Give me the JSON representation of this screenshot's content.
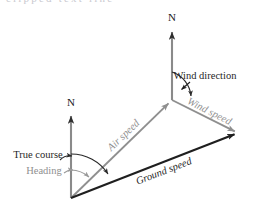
{
  "figure": {
    "kind": "vector-diagram",
    "topic": "aircraft navigation velocity triangle",
    "background_color": "#ffffff"
  },
  "colors": {
    "dark": "#1f1f1f",
    "gray": "#909090",
    "axis_gray": "#8a8a8a",
    "arc_dark": "#2a2a2a",
    "arc_gray": "#9a9a9a"
  },
  "axes": {
    "lower_north": {
      "label": "N",
      "tip": {
        "x": 71,
        "y": 112
      },
      "base": {
        "x": 71,
        "y": 198
      },
      "label_pos": {
        "x": 71,
        "y": 103
      }
    },
    "upper_north": {
      "label": "N",
      "tip": {
        "x": 172,
        "y": 28
      },
      "base": {
        "x": 172,
        "y": 100
      },
      "label_pos": {
        "x": 172,
        "y": 18
      }
    }
  },
  "vectors": [
    {
      "id": "air-speed",
      "label": "Air speed",
      "color": "gray",
      "from": {
        "x": 71,
        "y": 198
      },
      "to": {
        "x": 172,
        "y": 100
      },
      "label_pos": {
        "x": 124,
        "y": 136
      },
      "label_rotation_deg": -44
    },
    {
      "id": "wind-speed",
      "label": "Wind speed",
      "color": "gray",
      "from": {
        "x": 172,
        "y": 100
      },
      "to": {
        "x": 238,
        "y": 133
      },
      "label_pos": {
        "x": 210,
        "y": 111
      },
      "label_rotation_deg": 27
    },
    {
      "id": "ground-speed",
      "label": "Ground speed",
      "color": "dark",
      "from": {
        "x": 71,
        "y": 198
      },
      "to": {
        "x": 238,
        "y": 133
      },
      "label_pos": {
        "x": 164,
        "y": 172
      },
      "label_rotation_deg": -21
    }
  ],
  "angles": [
    {
      "id": "true-course",
      "label": "True course",
      "color": "dark",
      "vertex": {
        "x": 71,
        "y": 198
      },
      "from_ray": "lower-north-axis",
      "to_ray": "ground-speed",
      "label_pos": {
        "x": 38,
        "y": 156
      }
    },
    {
      "id": "heading",
      "label": "Heading",
      "color": "gray",
      "vertex": {
        "x": 71,
        "y": 198
      },
      "from_ray": "lower-north-axis",
      "to_ray": "air-speed",
      "label_pos": {
        "x": 44,
        "y": 172
      }
    },
    {
      "id": "wind-direction",
      "label": "Wind direction",
      "color": "dark",
      "vertex": {
        "x": 172,
        "y": 100
      },
      "from_ray": "upper-north-axis",
      "to_ray": "wind-speed",
      "label_pos": {
        "x": 205,
        "y": 77
      }
    }
  ],
  "top_crop": {
    "text": "clipped text line"
  }
}
